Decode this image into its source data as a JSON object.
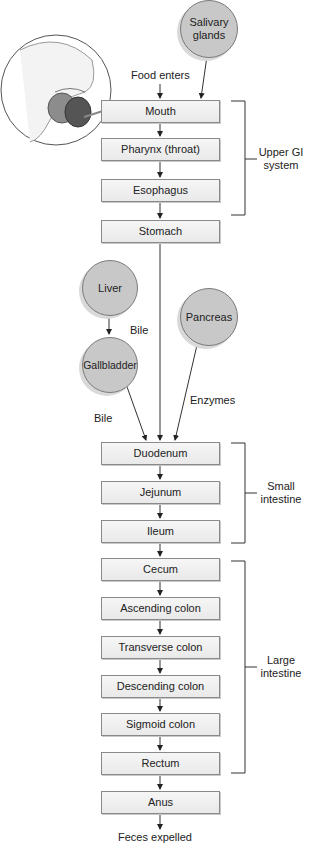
{
  "labels": {
    "food_enters": "Food enters",
    "feces_expelled": "Feces expelled",
    "bile_1": "Bile",
    "bile_2": "Bile",
    "enzymes": "Enzymes"
  },
  "accessory_organs": {
    "salivary": "Salivary glands",
    "salivary_l1": "Salivary",
    "salivary_l2": "glands",
    "liver": "Liver",
    "gallbladder": "Gallbladder",
    "pancreas": "Pancreas"
  },
  "tract": [
    {
      "label": "Mouth"
    },
    {
      "label": "Pharynx (throat)"
    },
    {
      "label": "Esophagus"
    },
    {
      "label": "Stomach"
    },
    {
      "label": "Duodenum"
    },
    {
      "label": "Jejunum"
    },
    {
      "label": "Ileum"
    },
    {
      "label": "Cecum"
    },
    {
      "label": "Ascending colon"
    },
    {
      "label": "Transverse colon"
    },
    {
      "label": "Descending colon"
    },
    {
      "label": "Sigmoid colon"
    },
    {
      "label": "Rectum"
    },
    {
      "label": "Anus"
    }
  ],
  "groups": {
    "upper_gi_l1": "Upper GI",
    "upper_gi_l2": "system",
    "small_l1": "Small",
    "small_l2": "intestine",
    "large_l1": "Large",
    "large_l2": "intestine"
  },
  "illustration": "mouth-illustration"
}
